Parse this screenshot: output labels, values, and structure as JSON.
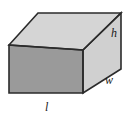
{
  "figure": {
    "kind": "geometry-diagram",
    "shape_name": "rectangular-box",
    "projection": "oblique",
    "background_color": "#ffffff",
    "outline_color": "#2b2b2b",
    "outline_width": 1.6,
    "faces": {
      "top": {
        "name": "top-face",
        "fill": "#d5d5d5",
        "points": "9,45 38,13 121,13 83,50"
      },
      "front": {
        "name": "front-face",
        "fill": "#9a9a9a",
        "points": "9,45 83,50 83,93 9,93"
      },
      "right": {
        "name": "right-face",
        "fill": "#d0d0d0",
        "points": "83,50 121,13 121,69 83,93"
      }
    },
    "edges": {
      "top_back": "38,13 121,13",
      "top_left_diagonal": "9,45 38,13",
      "top_front": "9,45 83,50",
      "front_right_diagonal": "83,50 121,13",
      "front_left_vertical": "9,45 9,93",
      "front_right_vertical": "83,50 83,93",
      "front_bottom": "9,93 83,93",
      "bottom_right_diagonal": "83,93 121,69",
      "right_vertical": "121,13 121,69"
    },
    "labels": [
      {
        "id": "h",
        "name": "height-label",
        "text": "h",
        "meaning": "height",
        "x": 111,
        "y": 27
      },
      {
        "id": "w",
        "name": "width-label",
        "text": "w",
        "meaning": "width",
        "x": 105,
        "y": 74
      },
      {
        "id": "l",
        "name": "length-label",
        "text": "l",
        "meaning": "length",
        "x": 45,
        "y": 101
      }
    ]
  }
}
